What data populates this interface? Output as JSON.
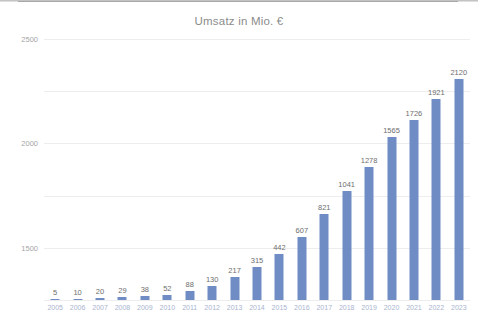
{
  "chart_data": {
    "type": "bar",
    "title": "Umsatz in Mio. €",
    "xlabel": "",
    "ylabel": "",
    "ylim": [
      0,
      2500
    ],
    "yticks": [
      0,
      500,
      1000,
      1500,
      2000,
      2500
    ],
    "ytick_labels": [
      "0",
      "500",
      "1000",
      "1500",
      "2000",
      "2500"
    ],
    "grid": true,
    "legend": "none",
    "bar_color": "#6f8cc4",
    "label_color": "#6e6e6e",
    "categories": [
      "2005",
      "2006",
      "2007",
      "2008",
      "2009",
      "2010",
      "2011",
      "2012",
      "2013",
      "2014",
      "2015",
      "2016",
      "2017",
      "2018",
      "2019",
      "2020",
      "2021",
      "2022",
      "2023"
    ],
    "values": [
      5,
      10,
      20,
      29,
      38,
      52,
      88,
      130,
      217,
      315,
      442,
      607,
      821,
      1041,
      1278,
      1565,
      1726,
      1921,
      2120
    ],
    "value_labels": [
      "5",
      "10",
      "20",
      "29",
      "38",
      "52",
      "88",
      "130",
      "217",
      "315",
      "442",
      "607",
      "821",
      "1041",
      "1278",
      "1565",
      "1726",
      "1921",
      "2120"
    ]
  }
}
